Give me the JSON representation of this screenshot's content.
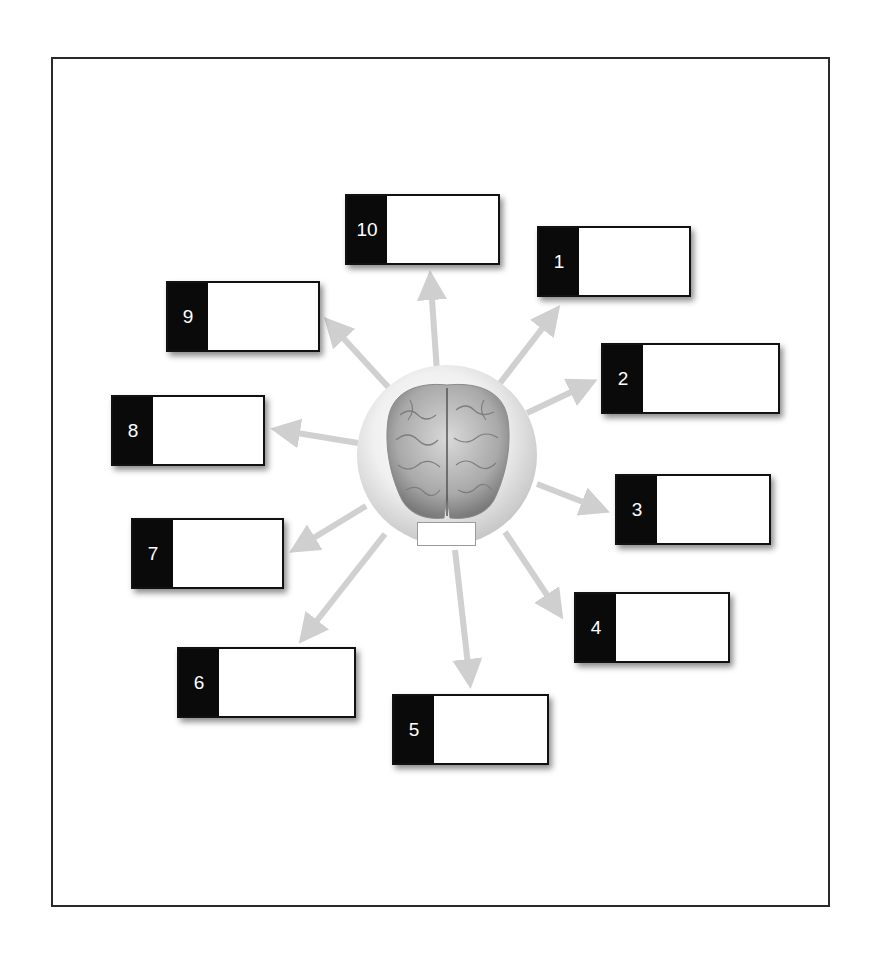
{
  "diagram": {
    "type": "brain-labeling-worksheet",
    "center": {
      "icon": "brain-image",
      "label_value": ""
    },
    "boxes": [
      {
        "number": "1",
        "value": ""
      },
      {
        "number": "2",
        "value": ""
      },
      {
        "number": "3",
        "value": ""
      },
      {
        "number": "4",
        "value": ""
      },
      {
        "number": "5",
        "value": ""
      },
      {
        "number": "6",
        "value": ""
      },
      {
        "number": "7",
        "value": ""
      },
      {
        "number": "8",
        "value": ""
      },
      {
        "number": "9",
        "value": ""
      },
      {
        "number": "10",
        "value": ""
      }
    ],
    "colors": {
      "arrow": "#d0d0d0",
      "tab": "#0a0a0a",
      "frame": "#2a2a2a"
    }
  }
}
